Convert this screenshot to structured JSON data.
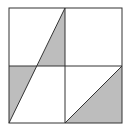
{
  "diagram": {
    "outer_square": {
      "x": 9,
      "y": 8,
      "width": 113,
      "height": 115
    },
    "center": {
      "x": 65,
      "y": 66
    },
    "colors": {
      "stroke": "#333333",
      "fill_shaded": "#bdbdbd",
      "background": "#ffffff"
    },
    "shaded_regions": [
      {
        "name": "upper-left-quadrant-triangle",
        "points": "65,8 65,66 37,66"
      },
      {
        "name": "lower-left-quadrant-triangle",
        "points": "9,66 37,66 9,123"
      },
      {
        "name": "lower-right-quadrant-triangle",
        "points": "65,123 122,66 122,123"
      }
    ],
    "lines": [
      {
        "name": "long-diagonal",
        "x1": 65,
        "y1": 8,
        "x2": 9,
        "y2": 123
      },
      {
        "name": "lower-right-diagonal",
        "x1": 65,
        "y1": 123,
        "x2": 122,
        "y2": 66
      }
    ]
  }
}
